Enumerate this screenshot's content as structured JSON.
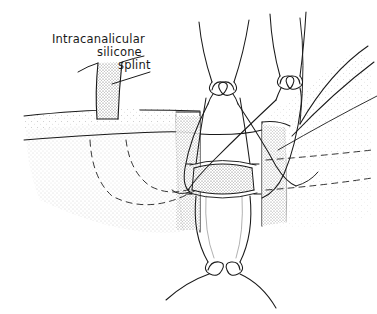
{
  "figure": {
    "title": "Intracanalicular silicone splint",
    "medium": "pen-and-ink stipple line drawing",
    "width": 377,
    "height": 314,
    "background_color": "#ffffff",
    "ink_color": "#1a1a1a",
    "stipple_color": "#555555"
  },
  "annotation": {
    "line1": "Intracanalicular",
    "line2": "silicone",
    "line3": "splint",
    "leader_from": [
      150,
      72
    ],
    "leader_to": [
      112,
      84
    ]
  },
  "structures": {
    "splint_tube": "vertical silicone splint stent emerging from punctum",
    "wound_edge_left": "cut tissue edge left",
    "wound_edge_right": "cut tissue edge right",
    "canaliculus_proximal": "proximal canalicular segment",
    "canaliculus_distal": "distal canalicular segment",
    "anastomosis_band": "stippled anastomosis collar",
    "lid_margin_arcs": "eyelid margin contour arcs",
    "hidden_lines": "dashed hidden lacrimal outline"
  },
  "sutures": {
    "knot_count": 3,
    "knots": [
      {
        "name": "knot-upper-left",
        "cx": 222,
        "cy": 90
      },
      {
        "name": "knot-upper-right",
        "cx": 289,
        "cy": 83
      },
      {
        "name": "knot-lower",
        "cx": 225,
        "cy": 268
      }
    ]
  }
}
